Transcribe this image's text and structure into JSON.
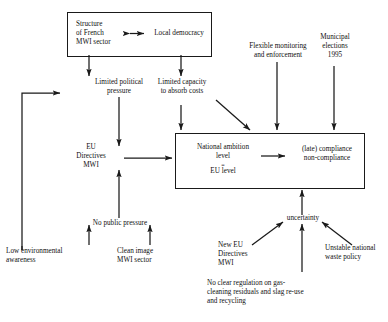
{
  "diagram": {
    "title_present": false,
    "style": {
      "line_color": "#1a1a1a",
      "text_color": "#111111",
      "background": "#ffffff"
    },
    "nodes": {
      "structure_french_mwi": "Structure\nof French\nMWI sector",
      "local_democracy": "Local democracy",
      "limited_political_pressure": "Limited political\npressure",
      "limited_capacity": "Limited capacity\nto absorb costs",
      "flexible_monitoring": "Flexible monitoring\nand enforcement",
      "municipal_elections": "Municipal\nelections\n1995",
      "eu_directives_mwi": "EU\nDirectives\nMWI",
      "national_ambition_left": "National ambition\nlevel",
      "national_ambition_equals": "=",
      "national_ambition_eu_level": "EU level",
      "compliance": "(late) compliance\nnon-compliance",
      "low_environmental_awareness": "Low environmental\nawareness",
      "no_public_pressure": "No public pressure",
      "clean_image_mwi": "Clean image\nMWI sector",
      "new_eu_directives_mwi": "New EU\nDirectives\nMWI",
      "uncertainty": "uncertainty",
      "unstable_waste_policy": "Unstable national\nwaste policy",
      "no_clear_regulation": "No clear regulation on gas-\ncleaning residuals and slag re-use\nand recycling"
    }
  }
}
